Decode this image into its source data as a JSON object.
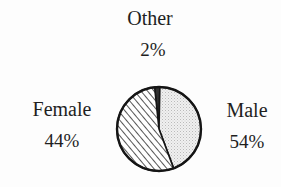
{
  "chart_data": {
    "type": "pie",
    "title": "",
    "subtitle": "",
    "xlabel": "",
    "ylabel": "",
    "legend_position": "outside-labels",
    "grid": false,
    "categories": [
      "Other",
      "Female",
      "Male"
    ],
    "values": [
      2,
      44,
      54
    ],
    "unit": "%",
    "slices": [
      {
        "name": "Other",
        "value": 2,
        "value_label": "2%",
        "fill": "solid-dark",
        "color": "#2b2b2b",
        "label_position": "top"
      },
      {
        "name": "Female",
        "value": 44,
        "value_label": "44%",
        "fill": "light-gray-stipple",
        "color": "#e3e3e3",
        "label_position": "left"
      },
      {
        "name": "Male",
        "value": 54,
        "value_label": "54%",
        "fill": "diagonal-hatch",
        "color": "#ffffff",
        "label_position": "right"
      }
    ],
    "start_angle_deg": -6,
    "direction": "clockwise",
    "outline_color": "#111111",
    "background": "#fdfdfd"
  },
  "labels": {
    "other": {
      "name": "Other",
      "value": "2%"
    },
    "female": {
      "name": "Female",
      "value": "44%"
    },
    "male": {
      "name": "Male",
      "value": "54%"
    }
  }
}
